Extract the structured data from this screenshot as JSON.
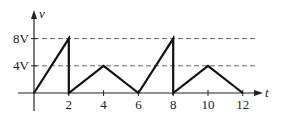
{
  "chart_data": {
    "type": "line",
    "title": "",
    "xlabel": "t",
    "ylabel": "v",
    "x_ticks": [
      2,
      4,
      6,
      8,
      10,
      12
    ],
    "x_tick_labels": [
      "2",
      "4",
      "6",
      "8",
      "10",
      "12"
    ],
    "y_ticks": [
      4,
      8
    ],
    "y_tick_labels": [
      "4V",
      "8V"
    ],
    "xlim": [
      0,
      12
    ],
    "ylim": [
      0,
      8
    ],
    "grid": "dashed horizontal reference lines at 4V and 8V",
    "legend": null,
    "series": [
      {
        "name": "v(t)",
        "points": [
          [
            0,
            0
          ],
          [
            2,
            8
          ],
          [
            2,
            0
          ],
          [
            4,
            4
          ],
          [
            6,
            0
          ],
          [
            8,
            8
          ],
          [
            8,
            0
          ],
          [
            10,
            4
          ],
          [
            12,
            0
          ]
        ]
      }
    ]
  },
  "colors": {
    "axis": "#222222",
    "waveform": "#111111",
    "dashed": "#555555"
  }
}
